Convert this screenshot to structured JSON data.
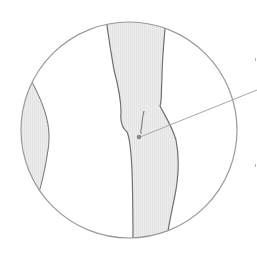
{
  "diagram": {
    "type": "anatomical-illustration",
    "subject": "leg-knee-lateral-view",
    "colors": {
      "background": "#ffffff",
      "circle_stroke": "#9a9a9a",
      "limb_fill": "#ececec",
      "limb_stripe": "#e2e2e2",
      "limb_stroke": "#6f6f6f",
      "point_fill": "#8a8a8a",
      "leader_line": "#a8a8a8"
    },
    "elements": {
      "magnifier_circle": "circle",
      "main_leg": "leg",
      "side_limb": "adjacent-limb",
      "marker_point": "point",
      "leader_line": "leader"
    }
  }
}
